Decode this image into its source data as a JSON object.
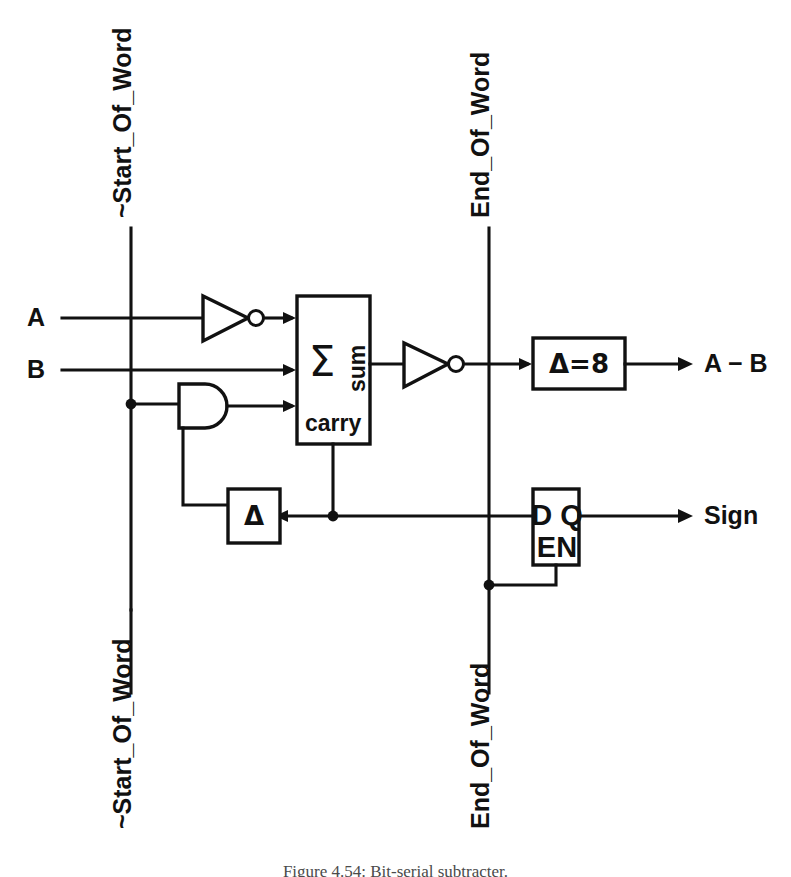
{
  "figure": {
    "caption": "Figure 4.54: Bit-serial subtracter.",
    "kind": "digital logic schematic",
    "width": 791,
    "height": 877,
    "ink_color": "#111111",
    "background_color": "#ffffff"
  },
  "signals": {
    "start_of_word_top": "~Start_Of_Word",
    "start_of_word_bottom": "~Start_Of_Word",
    "end_of_word_top": "End_Of_Word",
    "end_of_word_bottom": "End_Of_Word"
  },
  "inputs": [
    {
      "label": "A",
      "y": 318
    },
    {
      "label": "B",
      "y": 370
    }
  ],
  "outputs": [
    {
      "label": "A − B",
      "y": 364
    },
    {
      "label": "Sign",
      "y": 516
    }
  ],
  "blocks": {
    "adder": {
      "symbol": "Σ",
      "port_sum": "sum",
      "port_carry": "carry"
    },
    "delay_eight": {
      "label": "Δ=8"
    },
    "delay_one": {
      "label": "Δ"
    },
    "flipflop": {
      "data_port": "D",
      "output_port": "Q",
      "enable_port": "EN",
      "combined_top": "D Q",
      "combined_bottom": "EN"
    },
    "and_gate": {
      "name": "AND"
    },
    "inverter_a": {
      "name": "inverter"
    },
    "inverter_sum": {
      "name": "inverter"
    }
  }
}
